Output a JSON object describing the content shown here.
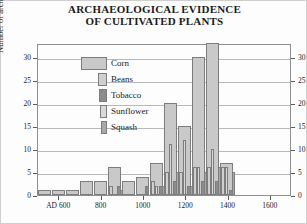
{
  "chart_data": {
    "type": "bar",
    "title": "ARCHAEOLOGICAL EVIDENCE OF CULTIVATED PLANTS",
    "title_line1": "ARCHAEOLOGICAL EVIDENCE",
    "title_line2": "OF CULTIVATED PLANTS",
    "xlabel": "",
    "ylabel": "Number of archaeological sites",
    "ylim": [
      0,
      33
    ],
    "yticks": [
      0,
      5,
      10,
      15,
      20,
      25,
      30
    ],
    "ytick_labels": [
      "0",
      "5",
      "10",
      "15",
      "20",
      "25",
      "30"
    ],
    "xlim": [
      500,
      1700
    ],
    "xticks": [
      600,
      800,
      1000,
      1200,
      1400,
      1600
    ],
    "xtick_labels": [
      "AD 600",
      "800",
      "1000",
      "1200",
      "1400",
      "1600"
    ],
    "grid": true,
    "legend_position": "upper-left-inside",
    "bin_width": 50,
    "bin_starts": [
      550,
      600,
      650,
      700,
      750,
      800,
      850,
      900,
      950,
      1000,
      1050,
      1100,
      1150,
      1200,
      1250,
      1300,
      1350,
      1400,
      1450,
      1500,
      1550,
      1600,
      1650
    ],
    "series": [
      {
        "name": "Corn",
        "color": "#c9c9c9",
        "bar_width_px": 11,
        "values": [
          1,
          1,
          1,
          1,
          1,
          3,
          3,
          3,
          6,
          6,
          3,
          3,
          4,
          7,
          7,
          20,
          20,
          15,
          30,
          30,
          33,
          7,
          7
        ]
      },
      {
        "name": "Beans",
        "color": "#cfcfcf",
        "bar_width_px": 4,
        "values": [
          0,
          0,
          0,
          0,
          0,
          0,
          0,
          0,
          2,
          2,
          0,
          0,
          0,
          3,
          3,
          5,
          5,
          5,
          6,
          6,
          6,
          6,
          6
        ]
      },
      {
        "name": "Tobacco",
        "color": "#8c8c8c",
        "bar_width_px": 4,
        "values": [
          0,
          0,
          0,
          0,
          0,
          0,
          0,
          0,
          2,
          2,
          0,
          0,
          2,
          2,
          2,
          3,
          3,
          2,
          3,
          3,
          3,
          1,
          1
        ]
      },
      {
        "name": "Sunflower",
        "color": "#d9d9d9",
        "bar_width_px": 3,
        "values": [
          0,
          0,
          0,
          0,
          0,
          0,
          0,
          0,
          0,
          0,
          0,
          0,
          0,
          2,
          2,
          11,
          11,
          12,
          6,
          6,
          10,
          6,
          6
        ]
      },
      {
        "name": "Squash",
        "color": "#a8a8a8",
        "bar_width_px": 3,
        "values": [
          0,
          0,
          0,
          0,
          0,
          0,
          0,
          0,
          0,
          1,
          0,
          0,
          0,
          2,
          2,
          5,
          5,
          2,
          5,
          5,
          6,
          5,
          5
        ]
      }
    ],
    "bar_groups": [
      {
        "x_px": 0,
        "corn": 1
      },
      {
        "x_px": 14,
        "corn": 1
      },
      {
        "x_px": 28,
        "corn": 1
      },
      {
        "x_px": 42,
        "corn": 3
      },
      {
        "x_px": 56,
        "corn": 3
      },
      {
        "x_px": 70,
        "corn": 6,
        "beans": 2,
        "tobacco": 2,
        "squash": 1
      },
      {
        "x_px": 84,
        "corn": 3
      },
      {
        "x_px": 98,
        "corn": 4,
        "tobacco": 2
      },
      {
        "x_px": 112,
        "corn": 7,
        "beans": 3,
        "tobacco": 2,
        "sunflower": 2,
        "squash": 2
      },
      {
        "x_px": 126,
        "corn": 20,
        "beans": 5,
        "tobacco": 3,
        "sunflower": 11,
        "squash": 5
      },
      {
        "x_px": 140,
        "corn": 15,
        "beans": 5,
        "tobacco": 2,
        "sunflower": 12,
        "squash": 2
      },
      {
        "x_px": 154,
        "corn": 30,
        "beans": 6,
        "tobacco": 3,
        "sunflower": 6,
        "squash": 5
      },
      {
        "x_px": 168,
        "corn": 33,
        "beans": 6,
        "tobacco": 3,
        "sunflower": 10,
        "squash": 6
      },
      {
        "x_px": 182,
        "corn": 7,
        "beans": 6,
        "tobacco": 1,
        "sunflower": 6,
        "squash": 5
      }
    ]
  },
  "legend": {
    "title": "",
    "items": [
      {
        "label": "Corn",
        "swatch_width": 26,
        "swatch_height": 13,
        "color": "#c9c9c9"
      },
      {
        "label": "Beans",
        "swatch_width": 9,
        "swatch_height": 13,
        "color": "#cfcfcf"
      },
      {
        "label": "Tobacco",
        "swatch_width": 8,
        "swatch_height": 13,
        "color": "#8c8c8c"
      },
      {
        "label": "Sunflower",
        "swatch_width": 7,
        "swatch_height": 13,
        "color": "#d9d9d9"
      },
      {
        "label": "Squash",
        "swatch_width": 6,
        "swatch_height": 13,
        "color": "#a8a8a8"
      }
    ]
  },
  "colors": {
    "corn": "#c9c9c9",
    "beans": "#cfcfcf",
    "tobacco": "#8c8c8c",
    "sunflower": "#d9d9d9",
    "squash": "#a8a8a8",
    "axis": "#8f8f8f",
    "grid": "#b9b9b9",
    "text": "#1b1b1b"
  }
}
